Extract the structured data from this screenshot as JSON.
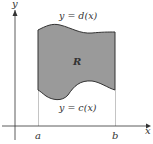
{
  "diagram": {
    "axes": {
      "x_label": "x",
      "y_label": "y"
    },
    "ticks": {
      "a": "a",
      "b": "b"
    },
    "curves": {
      "top": "y = d(x)",
      "bottom": "y = c(x)"
    },
    "region_label": "R",
    "colors": {
      "region_fill": "#999999",
      "curve_stroke": "#333333",
      "axis": "#333333",
      "guide_lines": "#999999"
    }
  }
}
